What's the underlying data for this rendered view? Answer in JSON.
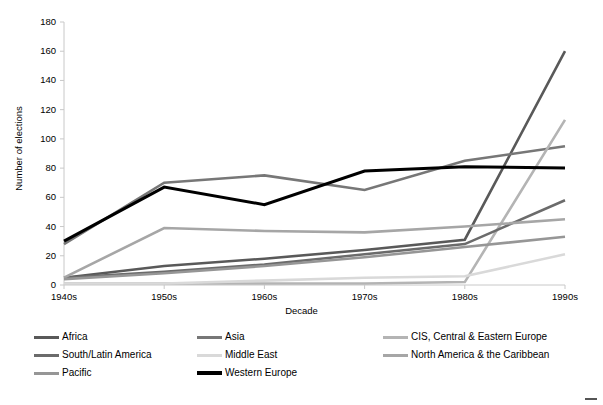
{
  "chart_data": {
    "type": "line",
    "title": "",
    "xlabel": "Decade",
    "ylabel": "Number of elections",
    "categories": [
      "1940s",
      "1950s",
      "1960s",
      "1970s",
      "1980s",
      "1990s"
    ],
    "ylim": [
      0,
      180
    ],
    "ytick_values": [
      0,
      20,
      40,
      60,
      80,
      100,
      120,
      140,
      160,
      180
    ],
    "ytick_labels": [
      "0",
      "20",
      "40",
      "60",
      "80",
      "100",
      "120",
      "140",
      "160",
      "180"
    ],
    "grid": false,
    "legend_position": "bottom",
    "series": [
      {
        "name": "Africa",
        "color": "#595959",
        "width": 2.6,
        "values": [
          5,
          13,
          18,
          24,
          31,
          160
        ]
      },
      {
        "name": "Asia",
        "color": "#777777",
        "width": 2.6,
        "values": [
          28,
          70,
          75,
          65,
          85,
          95
        ]
      },
      {
        "name": "CIS, Central & Eastern Europe",
        "color": "#b4b4b4",
        "width": 2.6,
        "values": [
          1,
          1,
          1,
          1,
          2,
          113
        ]
      },
      {
        "name": "South/Latin America",
        "color": "#6b6b6b",
        "width": 2.6,
        "values": [
          5,
          9,
          14,
          21,
          28,
          58
        ]
      },
      {
        "name": "Middle East",
        "color": "#d9d9d9",
        "width": 2.6,
        "values": [
          1,
          1,
          3,
          5,
          6,
          21
        ]
      },
      {
        "name": "North America & the Caribbean",
        "color": "#a6a6a6",
        "width": 2.6,
        "values": [
          5,
          39,
          37,
          36,
          40,
          45
        ]
      },
      {
        "name": "Pacific",
        "color": "#969696",
        "width": 2.6,
        "values": [
          4,
          8,
          13,
          19,
          26,
          33
        ]
      },
      {
        "name": "Western Europe",
        "color": "#000000",
        "width": 3.0,
        "values": [
          30,
          67,
          55,
          78,
          81,
          80
        ]
      }
    ]
  },
  "legend": {
    "items": [
      {
        "label": "Africa",
        "color": "#595959",
        "col": 0,
        "row": 0
      },
      {
        "label": "Asia",
        "color": "#777777",
        "col": 1,
        "row": 0
      },
      {
        "label": "CIS, Central & Eastern Europe",
        "color": "#b4b4b4",
        "col": 2,
        "row": 0
      },
      {
        "label": "South/Latin America",
        "color": "#6b6b6b",
        "col": 0,
        "row": 1
      },
      {
        "label": "Middle East",
        "color": "#d9d9d9",
        "col": 1,
        "row": 1
      },
      {
        "label": "North America & the Caribbean",
        "color": "#a6a6a6",
        "col": 2,
        "row": 1
      },
      {
        "label": "Pacific",
        "color": "#969696",
        "col": 0,
        "row": 2
      },
      {
        "label": "Western Europe",
        "color": "#000000",
        "col": 1,
        "row": 2
      }
    ]
  },
  "axes": {
    "axis_color": "#c8c8c8",
    "tick_color": "#c8c8c8"
  }
}
